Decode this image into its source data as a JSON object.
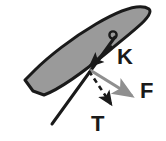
{
  "figure": {
    "type": "force-diagram",
    "title": "",
    "background_color": "#ffffff",
    "blade": {
      "name": "blade-ellipse",
      "fill_color": "#9a9a9a",
      "stroke_color": "#1a1a1a",
      "stroke_width": 3,
      "angle_deg": -27
    },
    "pivot_point": {
      "name": "pivot",
      "x": 86,
      "y": 68
    },
    "shaft": {
      "name": "shaft-line",
      "color": "#1a1a1a",
      "width": 3,
      "from_x": 115,
      "from_y": 37,
      "to_x": 52,
      "to_y": 124
    },
    "handle_knob": {
      "name": "handle-knob",
      "x": 113,
      "y": 35,
      "r": 3.5,
      "color": "#1a1a1a"
    },
    "vectors": [
      {
        "id": "K",
        "label": "K",
        "style": "solid",
        "color": "#1a1a1a",
        "label_x": 118,
        "label_y": 64,
        "direction": "up-right to down-left",
        "tail_x": 110,
        "tail_y": 48,
        "tip_x": 88,
        "tip_y": 67
      },
      {
        "id": "F",
        "label": "F",
        "style": "solid",
        "color": "#8f8f8f",
        "label_x": 143,
        "label_y": 97,
        "direction": "down-right",
        "tail_x": 90,
        "tail_y": 70,
        "tip_x": 136,
        "tip_y": 98
      },
      {
        "id": "T",
        "label": "T",
        "style": "dashed",
        "color": "#1a1a1a",
        "label_x": 96,
        "label_y": 128,
        "direction": "down-right (steeper)",
        "tail_x": 89,
        "tail_y": 71,
        "tip_x": 115,
        "tip_y": 108
      }
    ],
    "labels": {
      "k_label": "K",
      "f_label": "F",
      "t_label": "T"
    },
    "colors": {
      "ink": "#1a1a1a",
      "blade_fill": "#9a9a9a",
      "force_gray": "#8f8f8f",
      "paper": "#ffffff"
    }
  }
}
